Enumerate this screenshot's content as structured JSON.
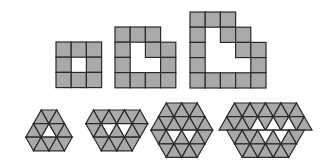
{
  "colors": {
    "fill": "#a9a9a9",
    "stroke": "#2a2a2a",
    "hole": "#ffffff"
  },
  "square_figures": [
    {
      "name": "square-figure-1",
      "rows": [
        "###",
        "#.#",
        "###"
      ]
    },
    {
      "name": "square-figure-2",
      "rows": [
        "###.",
        "#.##",
        "#..#",
        "####"
      ]
    },
    {
      "name": "square-figure-3",
      "rows": [
        "###..",
        "#.##.",
        "#..##",
        "#...#",
        "#####"
      ]
    }
  ],
  "triangle_figures": [
    {
      "name": "hex-figure-1",
      "rows": [
        {
          "offset": 2,
          "first": "up",
          "count": 3,
          "holes": []
        },
        {
          "offset": 1,
          "first": "up",
          "count": 5,
          "holes": [
            2
          ]
        },
        {
          "offset": 1,
          "first": "down",
          "count": 5,
          "holes": []
        }
      ]
    },
    {
      "name": "hex-figure-2",
      "rows": [
        {
          "offset": 1,
          "first": "up",
          "count": 7,
          "holes": []
        },
        {
          "offset": 1,
          "first": "down",
          "count": 7,
          "holes": [
            2,
            4
          ]
        },
        {
          "offset": 2,
          "first": "down",
          "count": 5,
          "holes": []
        }
      ]
    },
    {
      "name": "hex-figure-3",
      "rows": [
        {
          "offset": 2,
          "first": "up",
          "count": 5,
          "holes": []
        },
        {
          "offset": 1,
          "first": "up",
          "count": 7,
          "holes": []
        },
        {
          "offset": 1,
          "first": "down",
          "count": 7,
          "holes": [
            2,
            4
          ]
        },
        {
          "offset": 2,
          "first": "down",
          "count": 5,
          "holes": []
        }
      ]
    },
    {
      "name": "hex-figure-4",
      "rows": [
        {
          "offset": 1,
          "first": "up",
          "count": 9,
          "holes": []
        },
        {
          "offset": 0,
          "first": "up",
          "count": 11,
          "holes": [
            4,
            6,
            8
          ]
        },
        {
          "offset": 1,
          "first": "down",
          "count": 9,
          "holes": [
            4,
            6
          ]
        },
        {
          "offset": 2,
          "first": "down",
          "count": 7,
          "holes": []
        }
      ]
    }
  ]
}
